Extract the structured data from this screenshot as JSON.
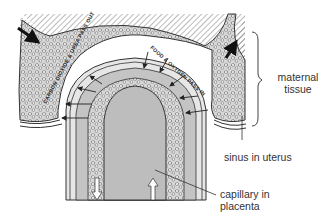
{
  "diagram": {
    "colors": {
      "background": "#ffffff",
      "maternal_hatch": "#777777",
      "blood_fill": "#d9d9d9",
      "villus_core": "#bdbdbd",
      "outline": "#333333",
      "cells": "#ffffff",
      "text": "#333333"
    },
    "inline_labels": {
      "out_label": "CARBON DIOXIDE & UREA PASS OUT",
      "in_label": "FOOD & OXYGEN PASS IN"
    },
    "callouts": {
      "maternal_tissue_line1": "maternal",
      "maternal_tissue_line2": "tissue",
      "sinus": "sinus in uterus",
      "capillary_line1": "capillary in",
      "capillary_line2": "placenta"
    },
    "arrows": {
      "blood_inflow": "arrow-down-right",
      "blood_outflow": "arrow-up-right",
      "exchange_in_count": 5,
      "exchange_out_count": 3,
      "capillary_flow": [
        "arrow-down",
        "arrow-up"
      ]
    }
  }
}
